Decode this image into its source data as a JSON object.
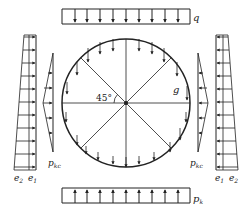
{
  "diagram": {
    "type": "structural load diagram",
    "labels": {
      "top_load": "q",
      "self_weight": "g",
      "angle": "45°",
      "left_triangle": "p",
      "left_triangle_sub": "kc",
      "right_triangle": "p",
      "right_triangle_sub": "kc",
      "left_e2": "e",
      "left_e2_sub": "2",
      "left_e1": "e",
      "left_e1_sub": "1",
      "right_e1": "e",
      "right_e1_sub": "1",
      "right_e2": "e",
      "right_e2_sub": "2",
      "bottom_load": "p",
      "bottom_load_sub": "k"
    },
    "colors": {
      "stroke": "#222222",
      "background": "#ffffff"
    }
  }
}
